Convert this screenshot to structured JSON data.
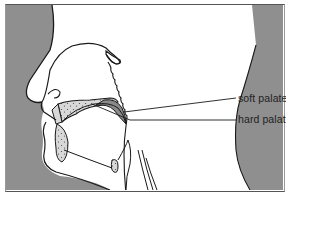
{
  "figure": {
    "labels": [
      {
        "id": "soft-palate",
        "text": "soft palate"
      },
      {
        "id": "hard-palate",
        "text": "hard palate"
      }
    ],
    "colors": {
      "background_shade": "#8f8f8f",
      "line": "#1a1a1a",
      "palate_fill": "#c9c9c9",
      "highlight_fill": "#7a7a7a",
      "paper": "#ffffff"
    }
  }
}
